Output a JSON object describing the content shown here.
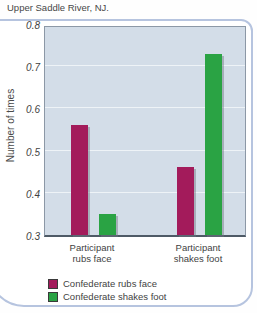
{
  "title": "Upper Saddle River, NJ.",
  "colors": {
    "series_maroon": "#a31b5b",
    "series_green": "#2aa344",
    "plot_background": "#d3dde8",
    "gridline": "#eef3f7",
    "plot_border": "#8c98a6",
    "axis_line": "#4e5a66",
    "card_border": "#b6c4df",
    "text": "#3f3f3f"
  },
  "chart_data": {
    "type": "bar",
    "title": "Upper Saddle River, NJ.",
    "xlabel": "",
    "ylabel": "Number of times",
    "ylim": [
      0.3,
      0.8
    ],
    "yticks": [
      0.3,
      0.4,
      0.5,
      0.6,
      0.7,
      0.8
    ],
    "grid": true,
    "legend_position": "bottom-left",
    "categories": [
      [
        "Participant",
        "rubs face"
      ],
      [
        "Participant",
        "shakes foot"
      ]
    ],
    "series": [
      {
        "name": "Confederate rubs face",
        "color": "#a31b5b",
        "values": [
          0.56,
          0.46
        ]
      },
      {
        "name": "Confederate shakes foot",
        "color": "#2aa344",
        "values": [
          0.35,
          0.73
        ]
      }
    ]
  }
}
